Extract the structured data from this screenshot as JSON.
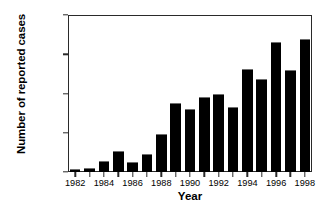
{
  "chart_data": {
    "type": "bar",
    "title": "",
    "xlabel": "Year",
    "ylabel": "Number of reported cases",
    "categories": [
      "1982",
      "1983",
      "1984",
      "1985",
      "1986",
      "1987",
      "1988",
      "1989",
      "1990",
      "1991",
      "1992",
      "1993",
      "1994",
      "1995",
      "1996",
      "1997",
      "1998"
    ],
    "values": [
      400,
      450,
      1450,
      2650,
      1300,
      2350,
      4850,
      8800,
      8000,
      9500,
      9900,
      8300,
      13150,
      11850,
      16550,
      12950,
      16900
    ],
    "ylim": [
      0,
      20000
    ],
    "xlim": [
      1981.5,
      1998.5
    ],
    "yticks": [
      0,
      5000,
      10000,
      15000,
      20000
    ],
    "ytick_labels": [
      "0",
      "5,000",
      "10,000",
      "15,000",
      "20,000"
    ],
    "xticks": [
      1982,
      1983,
      1984,
      1985,
      1986,
      1987,
      1988,
      1989,
      1990,
      1991,
      1992,
      1993,
      1994,
      1995,
      1996,
      1997,
      1998
    ],
    "xtick_labels": [
      "1982",
      "",
      "1984",
      "",
      "1986",
      "",
      "1988",
      "",
      "1990",
      "",
      "1992",
      "",
      "1994",
      "",
      "1996",
      "",
      "1998"
    ],
    "grid": false,
    "legend": null,
    "bar_color": "#000000",
    "axis_color": "#2a2a2a",
    "background_color": "#ffffff"
  }
}
